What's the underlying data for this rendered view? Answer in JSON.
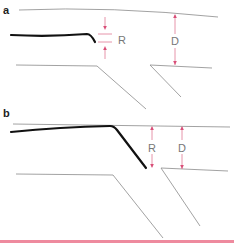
{
  "panels": [
    {
      "label": "a",
      "markers": {
        "r_label": "R",
        "d_label": "D"
      }
    },
    {
      "label": "b",
      "markers": {
        "r_label": "R",
        "d_label": "D"
      }
    }
  ],
  "colors": {
    "boundary_line": "#8a8a8a",
    "thick_line": "#111111",
    "dimension_marker": "#e07a95",
    "bottom_rule": "#ee8a9e"
  }
}
